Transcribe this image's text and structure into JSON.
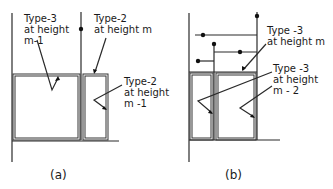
{
  "figure_a": {
    "caption": "(a)",
    "labels": {
      "type3_line1": "Type-3",
      "type3_line2": "at height",
      "type3_line3": "m-1",
      "type2m_line1": "Type-2",
      "type2m_line2": "at height m",
      "type2m1_line1": "Type-2",
      "type2m1_line2": "at height",
      "type2m1_line3": "m -1"
    }
  },
  "figure_b": {
    "caption": "(b)",
    "labels": {
      "type3m_line1": "Type -3",
      "type3m_line2": "at height m",
      "type3m2_line1": "Type -3",
      "type3m2_line2": "at height",
      "type3m2_line3": "m - 2"
    }
  }
}
